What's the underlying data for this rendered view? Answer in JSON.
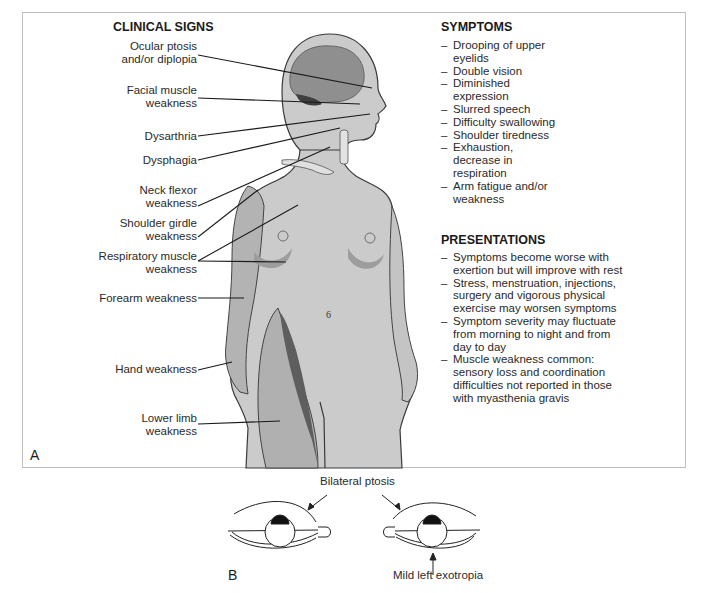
{
  "panel_a": {
    "letter": "A",
    "clinical_signs": {
      "heading": "CLINICAL SIGNS",
      "labels": [
        {
          "text": "Ocular ptosis\nand/or diplopia"
        },
        {
          "text": "Facial muscle\nweakness"
        },
        {
          "text": "Dysarthria"
        },
        {
          "text": "Dysphagia"
        },
        {
          "text": "Neck flexor\nweakness"
        },
        {
          "text": "Shoulder girdle\nweakness"
        },
        {
          "text": "Respiratory muscle\nweakness"
        },
        {
          "text": "Forearm weakness"
        },
        {
          "text": "Hand weakness"
        },
        {
          "text": "Lower limb\nweakness"
        }
      ]
    },
    "symptoms": {
      "heading": "SYMPTOMS",
      "items": [
        "Drooping of upper eyelids",
        "Double vision",
        "Diminished expression",
        "Slurred speech",
        "Difficulty swallowing",
        "Shoulder tiredness",
        "Exhaustion, decrease in respiration",
        "Arm fatigue and/or weakness"
      ]
    },
    "presentations": {
      "heading": "PRESENTATIONS",
      "items": [
        "Symptoms become worse with exertion but will improve with rest",
        "Stress, menstruation, injections, surgery and vigorous physical exercise may worsen symptoms",
        "Symptom severity may fluctuate from morning to night and from day to day",
        "Muscle weakness common: sensory loss and coordination difficulties not reported in those with myasthenia gravis"
      ]
    }
  },
  "panel_b": {
    "letter": "B",
    "top_label": "Bilateral ptosis",
    "bottom_label": "Mild left exotropia"
  },
  "colors": {
    "body_fill": "#c9c9c9",
    "body_shadow": "#a9a9a9",
    "muscle_dark": "#6e6e6e",
    "outline": "#333333",
    "border": "#bdbdbd"
  }
}
